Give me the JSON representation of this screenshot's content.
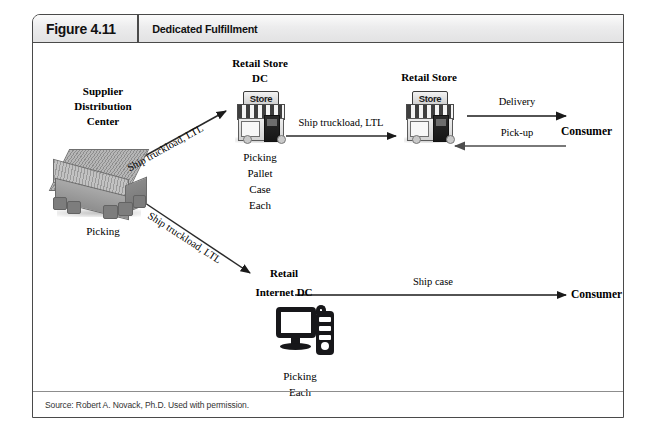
{
  "figure": {
    "number": "Figure 4.11",
    "title": "Dedicated Fulfillment",
    "source": "Source: Robert A. Novack, Ph.D. Used with permission."
  },
  "nodes": {
    "supplier_dc": {
      "title_line1": "Supplier",
      "title_line2": "Distribution",
      "title_line3": "Center",
      "icon": "warehouse-icon",
      "activities": [
        "Picking"
      ]
    },
    "retail_store_dc": {
      "title_line1": "Retail Store",
      "title_line2": "DC",
      "icon": "store-icon",
      "icon_sign": "Store",
      "activities": [
        "Picking",
        "Pallet",
        "Case",
        "Each"
      ]
    },
    "retail_store": {
      "title_line1": "Retail Store",
      "icon": "store-icon",
      "icon_sign": "Store"
    },
    "consumer_top": {
      "title": "Consumer"
    },
    "retail_internet_dc": {
      "title_line1": "Retail",
      "title_line2": "Internet DC",
      "icon": "computer-icon",
      "activities": [
        "Picking",
        "Each"
      ]
    },
    "consumer_bottom": {
      "title": "Consumer"
    }
  },
  "edges": {
    "supplier_to_store_dc": "Ship truckload, LTL",
    "supplier_to_internet_dc": "Ship truckload, LTL",
    "store_dc_to_store": "Ship truckload, LTL",
    "store_to_consumer": "Delivery",
    "consumer_to_store": "Pick-up",
    "internet_dc_to_consumer": "Ship case"
  },
  "colors": {
    "frame_border": "#4a4a4a",
    "header_bg": "#ececed",
    "line": "#1a1a1a",
    "text": "#000000"
  }
}
